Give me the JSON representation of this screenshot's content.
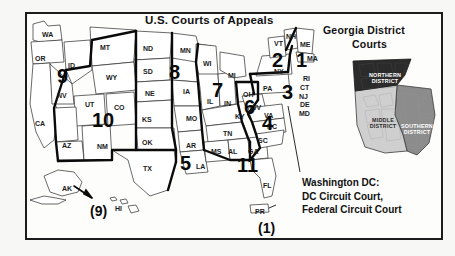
{
  "titles": {
    "main": "U.S. Courts of Appeals",
    "inset_line1": "Georgia District",
    "inset_line2": "Courts"
  },
  "annotation": {
    "dc_line1": "Washington DC:",
    "dc_line2": "DC Circuit Court,",
    "dc_line3": "Federal Circuit Court"
  },
  "circuits": [
    {
      "label": "1",
      "x": 296,
      "y": 50,
      "size": 20
    },
    {
      "label": "2",
      "x": 272,
      "y": 50,
      "size": 20
    },
    {
      "label": "3",
      "x": 282,
      "y": 82,
      "size": 20
    },
    {
      "label": "4",
      "x": 262,
      "y": 113,
      "size": 20
    },
    {
      "label": "5",
      "x": 180,
      "y": 153,
      "size": 20
    },
    {
      "label": "6",
      "x": 244,
      "y": 97,
      "size": 20
    },
    {
      "label": "7",
      "x": 212,
      "y": 80,
      "size": 20
    },
    {
      "label": "8",
      "x": 169,
      "y": 62,
      "size": 20
    },
    {
      "label": "9",
      "x": 57,
      "y": 66,
      "size": 20
    },
    {
      "label": "10",
      "x": 92,
      "y": 110,
      "size": 20
    },
    {
      "label": "11",
      "x": 237,
      "y": 155,
      "size": 20
    }
  ],
  "offshore_circuits": [
    {
      "label": "(9)",
      "x": 90,
      "y": 203
    },
    {
      "label": "(1)",
      "x": 258,
      "y": 220
    }
  ],
  "states": [
    {
      "abbr": "WA",
      "x": 42,
      "y": 31
    },
    {
      "abbr": "OR",
      "x": 35,
      "y": 55
    },
    {
      "abbr": "ID",
      "x": 68,
      "y": 62
    },
    {
      "abbr": "MT",
      "x": 100,
      "y": 44
    },
    {
      "abbr": "ND",
      "x": 143,
      "y": 45
    },
    {
      "abbr": "SD",
      "x": 143,
      "y": 68
    },
    {
      "abbr": "NE",
      "x": 145,
      "y": 90
    },
    {
      "abbr": "WY",
      "x": 106,
      "y": 74
    },
    {
      "abbr": "NV",
      "x": 57,
      "y": 92
    },
    {
      "abbr": "UT",
      "x": 85,
      "y": 101
    },
    {
      "abbr": "CO",
      "x": 114,
      "y": 104
    },
    {
      "abbr": "CA",
      "x": 35,
      "y": 120
    },
    {
      "abbr": "AZ",
      "x": 62,
      "y": 142
    },
    {
      "abbr": "NM",
      "x": 97,
      "y": 143
    },
    {
      "abbr": "KS",
      "x": 142,
      "y": 116
    },
    {
      "abbr": "OK",
      "x": 142,
      "y": 139
    },
    {
      "abbr": "TX",
      "x": 143,
      "y": 165
    },
    {
      "abbr": "MN",
      "x": 180,
      "y": 47
    },
    {
      "abbr": "IA",
      "x": 183,
      "y": 88
    },
    {
      "abbr": "MO",
      "x": 186,
      "y": 115
    },
    {
      "abbr": "AR",
      "x": 186,
      "y": 142
    },
    {
      "abbr": "LA",
      "x": 196,
      "y": 163
    },
    {
      "abbr": "WI",
      "x": 203,
      "y": 60
    },
    {
      "abbr": "IL",
      "x": 207,
      "y": 98
    },
    {
      "abbr": "IN",
      "x": 224,
      "y": 100
    },
    {
      "abbr": "MI",
      "x": 228,
      "y": 72
    },
    {
      "abbr": "OH",
      "x": 243,
      "y": 91
    },
    {
      "abbr": "KY",
      "x": 235,
      "y": 113
    },
    {
      "abbr": "TN",
      "x": 223,
      "y": 130
    },
    {
      "abbr": "MS",
      "x": 211,
      "y": 148
    },
    {
      "abbr": "AL",
      "x": 228,
      "y": 148
    },
    {
      "abbr": "GA",
      "x": 248,
      "y": 148
    },
    {
      "abbr": "FL",
      "x": 263,
      "y": 182
    },
    {
      "abbr": "SC",
      "x": 258,
      "y": 137
    },
    {
      "abbr": "NC",
      "x": 267,
      "y": 123
    },
    {
      "abbr": "WV",
      "x": 250,
      "y": 104
    },
    {
      "abbr": "VA",
      "x": 264,
      "y": 112
    },
    {
      "abbr": "PA",
      "x": 263,
      "y": 85
    },
    {
      "abbr": "NY",
      "x": 274,
      "y": 68
    },
    {
      "abbr": "VT",
      "x": 274,
      "y": 40
    },
    {
      "abbr": "NH",
      "x": 286,
      "y": 33
    },
    {
      "abbr": "ME",
      "x": 300,
      "y": 41
    },
    {
      "abbr": "MA",
      "x": 307,
      "y": 55
    },
    {
      "abbr": "RI",
      "x": 303,
      "y": 75
    },
    {
      "abbr": "CT",
      "x": 300,
      "y": 84
    },
    {
      "abbr": "NJ",
      "x": 299,
      "y": 93
    },
    {
      "abbr": "DE",
      "x": 300,
      "y": 101
    },
    {
      "abbr": "MD",
      "x": 299,
      "y": 110
    },
    {
      "abbr": "AK",
      "x": 62,
      "y": 185
    },
    {
      "abbr": "HI",
      "x": 115,
      "y": 205
    },
    {
      "abbr": "PR",
      "x": 255,
      "y": 208
    }
  ],
  "georgia_districts": [
    {
      "name_line1": "NORTHERN",
      "name_line2": "DISTRICT",
      "color": "#2b2b2b",
      "x": 12,
      "y": 17
    },
    {
      "name_line1": "MIDDLE",
      "name_line2": "DISTRICT",
      "color": "#cfcfcf",
      "x": 16,
      "y": 62
    },
    {
      "name_line1": "SOUTHERN",
      "name_line2": "DISTRICT",
      "color": "#8c8c8c",
      "x": 52,
      "y": 68
    }
  ],
  "colors": {
    "ink": "#111111",
    "frame": "#1c1c1c",
    "page": "#f7f7f5",
    "inset_northern": "#2b2b2b",
    "inset_middle": "#cfcfcf",
    "inset_southern": "#8c8c8c"
  }
}
